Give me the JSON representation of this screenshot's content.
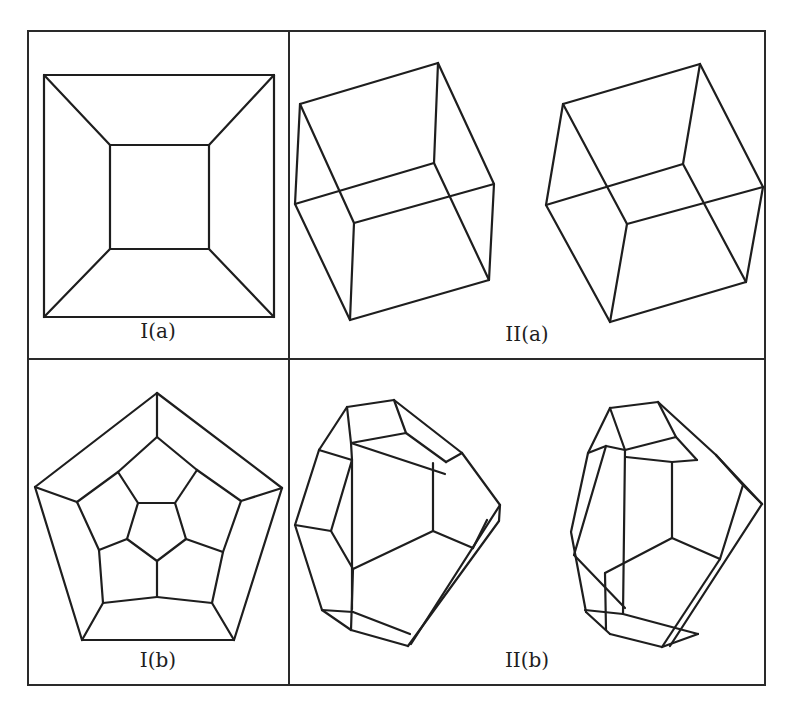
{
  "figure": {
    "panels": [
      {
        "id": "I(a)",
        "label": "I(a)",
        "label_pos": [
          158,
          319
        ],
        "description": "Planar (Schlegel) diagram of a cube: square inside square with corner connections"
      },
      {
        "id": "II(a)",
        "label": "II(a)",
        "label_pos": [
          527,
          322
        ],
        "description": "Stereo pair of wireframe cubes"
      },
      {
        "id": "I(b)",
        "label": "I(b)",
        "label_pos": [
          158,
          648
        ],
        "description": "Planar (Schlegel) diagram of a dodecahedron: nested pentagons"
      },
      {
        "id": "II(b)",
        "label": "II(b)",
        "label_pos": [
          527,
          648
        ],
        "description": "Stereo pair of wireframe dodecahedra"
      }
    ],
    "frame": {
      "x1": 28,
      "y1": 31,
      "x2": 765,
      "y2": 685,
      "vdiv_x": 289,
      "hdiv_y": 359
    },
    "line_color": "#1e1e1e"
  },
  "shapes": {
    "Ia": [
      [
        44,
        75,
        274,
        75
      ],
      [
        274,
        75,
        274,
        317
      ],
      [
        274,
        317,
        44,
        317
      ],
      [
        44,
        317,
        44,
        75
      ],
      [
        110,
        145,
        209,
        145
      ],
      [
        209,
        145,
        209,
        249
      ],
      [
        209,
        249,
        110,
        249
      ],
      [
        110,
        249,
        110,
        145
      ],
      [
        44,
        75,
        110,
        145
      ],
      [
        274,
        75,
        209,
        145
      ],
      [
        274,
        317,
        209,
        249
      ],
      [
        44,
        317,
        110,
        249
      ]
    ],
    "IIa_left": [
      [
        300,
        104,
        438,
        63
      ],
      [
        438,
        63,
        494,
        184
      ],
      [
        494,
        184,
        354,
        223
      ],
      [
        354,
        223,
        300,
        104
      ],
      [
        295,
        204,
        434,
        163
      ],
      [
        434,
        163,
        489,
        280
      ],
      [
        489,
        280,
        350,
        320
      ],
      [
        350,
        320,
        295,
        204
      ],
      [
        300,
        104,
        295,
        204
      ],
      [
        438,
        63,
        434,
        163
      ],
      [
        494,
        184,
        489,
        280
      ],
      [
        354,
        223,
        350,
        320
      ]
    ],
    "IIa_right": [
      [
        563,
        104,
        700,
        64
      ],
      [
        700,
        64,
        763,
        187
      ],
      [
        763,
        187,
        627,
        224
      ],
      [
        627,
        224,
        563,
        104
      ],
      [
        546,
        205,
        683,
        164
      ],
      [
        683,
        164,
        746,
        282
      ],
      [
        746,
        282,
        610,
        322
      ],
      [
        610,
        322,
        546,
        205
      ],
      [
        563,
        104,
        546,
        205
      ],
      [
        700,
        64,
        683,
        164
      ],
      [
        763,
        187,
        746,
        282
      ],
      [
        627,
        224,
        610,
        322
      ]
    ],
    "Ib": [
      [
        157,
        393,
        282,
        488
      ],
      [
        282,
        488,
        234,
        640
      ],
      [
        234,
        640,
        82,
        640
      ],
      [
        82,
        640,
        35,
        487
      ],
      [
        35,
        487,
        157,
        393
      ],
      [
        157,
        437,
        197,
        470
      ],
      [
        197,
        470,
        241,
        501
      ],
      [
        241,
        501,
        223,
        552
      ],
      [
        223,
        552,
        212,
        603
      ],
      [
        212,
        603,
        157,
        597
      ],
      [
        157,
        597,
        103,
        603
      ],
      [
        103,
        603,
        99,
        550
      ],
      [
        99,
        550,
        77,
        502
      ],
      [
        77,
        502,
        118,
        472
      ],
      [
        118,
        472,
        157,
        437
      ],
      [
        138,
        503,
        175,
        503
      ],
      [
        175,
        503,
        186,
        539
      ],
      [
        186,
        539,
        157,
        561
      ],
      [
        157,
        561,
        127,
        539
      ],
      [
        127,
        539,
        138,
        503
      ],
      [
        157,
        393,
        157,
        437
      ],
      [
        282,
        488,
        241,
        501
      ],
      [
        234,
        640,
        212,
        603
      ],
      [
        82,
        640,
        103,
        603
      ],
      [
        35,
        487,
        77,
        502
      ],
      [
        118,
        472,
        138,
        503
      ],
      [
        197,
        470,
        175,
        503
      ],
      [
        223,
        552,
        186,
        539
      ],
      [
        157,
        597,
        157,
        561
      ],
      [
        99,
        550,
        127,
        539
      ]
    ],
    "IIb_left": [
      [
        347,
        407,
        394,
        400
      ],
      [
        394,
        400,
        406,
        433
      ],
      [
        406,
        433,
        351,
        443
      ],
      [
        351,
        443,
        347,
        407
      ],
      [
        347,
        407,
        319,
        450
      ],
      [
        319,
        450,
        295,
        525
      ],
      [
        295,
        525,
        322,
        610
      ],
      [
        322,
        610,
        351,
        630
      ],
      [
        351,
        630,
        408,
        646
      ],
      [
        394,
        400,
        462,
        453
      ],
      [
        462,
        453,
        500,
        505
      ],
      [
        500,
        505,
        411,
        644
      ],
      [
        319,
        450,
        352,
        460
      ],
      [
        352,
        460,
        351,
        443
      ],
      [
        352,
        460,
        331,
        531
      ],
      [
        331,
        531,
        295,
        525
      ],
      [
        352,
        460,
        352,
        609
      ],
      [
        351,
        443,
        445,
        474
      ],
      [
        406,
        433,
        446,
        462
      ],
      [
        446,
        462,
        462,
        453
      ],
      [
        433,
        463,
        433,
        531
      ],
      [
        433,
        531,
        473,
        548
      ],
      [
        433,
        531,
        353,
        569
      ],
      [
        331,
        531,
        353,
        569
      ],
      [
        353,
        569,
        351,
        630
      ],
      [
        500,
        505,
        499,
        521
      ],
      [
        499,
        521,
        408,
        646
      ],
      [
        473,
        548,
        487,
        520
      ],
      [
        322,
        610,
        353,
        612
      ],
      [
        353,
        612,
        410,
        634
      ]
    ],
    "IIb_right": [
      [
        610,
        408,
        658,
        402
      ],
      [
        658,
        402,
        676,
        437
      ],
      [
        676,
        437,
        625,
        450
      ],
      [
        625,
        450,
        610,
        408
      ],
      [
        610,
        408,
        588,
        453
      ],
      [
        588,
        453,
        571,
        532
      ],
      [
        571,
        532,
        586,
        612
      ],
      [
        586,
        612,
        610,
        634
      ],
      [
        610,
        634,
        662,
        647
      ],
      [
        658,
        402,
        716,
        455
      ],
      [
        716,
        455,
        762,
        504
      ],
      [
        762,
        504,
        670,
        646
      ],
      [
        588,
        453,
        606,
        446
      ],
      [
        606,
        446,
        625,
        450
      ],
      [
        606,
        446,
        574,
        555
      ],
      [
        574,
        555,
        625,
        608
      ],
      [
        625,
        450,
        623,
        614
      ],
      [
        623,
        614,
        585,
        610
      ],
      [
        676,
        437,
        697,
        460
      ],
      [
        697,
        460,
        672,
        462
      ],
      [
        672,
        462,
        626,
        457
      ],
      [
        672,
        462,
        672,
        538
      ],
      [
        672,
        538,
        720,
        559
      ],
      [
        672,
        538,
        605,
        573
      ],
      [
        605,
        573,
        606,
        630
      ],
      [
        720,
        559,
        662,
        647
      ],
      [
        743,
        485,
        762,
        504
      ],
      [
        743,
        485,
        716,
        455
      ],
      [
        720,
        559,
        743,
        485
      ],
      [
        623,
        614,
        698,
        634
      ],
      [
        698,
        634,
        662,
        647
      ]
    ]
  }
}
